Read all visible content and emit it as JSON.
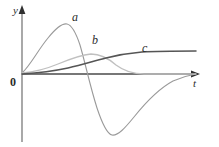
{
  "figure": {
    "title": "",
    "background_color": "#ffffff"
  },
  "axes": {
    "y_axis_label": "y",
    "x_axis_label": "t",
    "origin_label": "0",
    "axis_color": "#3a3a3a",
    "origin_px": {
      "x": 22,
      "y": 74
    },
    "x_axis_end_px": {
      "x": 198,
      "y": 74
    },
    "y_axis_top_px": {
      "x": 22,
      "y": 8
    },
    "y_axis_bottom_px": {
      "x": 22,
      "y": 142
    }
  },
  "curves": [
    {
      "id": "a",
      "label": "a",
      "color": "#9a9a9a",
      "stroke_width": 1.1,
      "description": "rises to a positive peak, crosses zero, dips to a deep negative trough, then returns asymptotically to zero",
      "path": "M 22,73 C 30,66 38,50 48,38 C 56,28 62,23 67,24 C 72,25 76,33 80,45 C 85,62 90,86 97,108 C 102,123 107,134 112,135 C 118,136 125,128 134,117 C 146,102 160,88 173,81 C 182,77 190,75 196,74"
    },
    {
      "id": "b",
      "label": "b",
      "color": "#c0c0c0",
      "stroke_width": 1.3,
      "description": "broad low hump peaking later than a, decaying smoothly back to zero",
      "path": "M 22,73 C 34,72 46,69 58,64 C 70,59 80,55 91,54 C 100,54 108,58 116,65 C 124,71 133,74 144,74 C 160,74 178,74 196,74"
    },
    {
      "id": "c",
      "label": "c",
      "color": "#555555",
      "stroke_width": 1.5,
      "description": "monotonic sigmoid rising from zero to a saturating plateau",
      "path": "M 22,74 C 38,73 54,71 68,68 C 82,65 94,61 106,58 C 118,55 130,53 142,52 C 158,51 176,51 196,51"
    }
  ],
  "curve_labels": [
    {
      "text": "a",
      "x": 72,
      "y": 11
    },
    {
      "text": "b",
      "x": 92,
      "y": 34
    },
    {
      "text": "c",
      "x": 142,
      "y": 42
    }
  ],
  "chart_data": {
    "type": "line",
    "title": "",
    "xlabel": "t",
    "ylabel": "y",
    "grid": false,
    "legend": "inline-curve-labels",
    "xlim": [
      0,
      1
    ],
    "ylim": [
      -1.2,
      1.05
    ],
    "axis_ticks": {
      "x": [],
      "y": []
    },
    "annotations": [
      "a",
      "b",
      "c",
      "0",
      "y",
      "t"
    ],
    "series": [
      {
        "name": "a",
        "color": "#9a9a9a",
        "x": [
          0.0,
          0.05,
          0.1,
          0.15,
          0.2,
          0.25,
          0.3,
          0.35,
          0.4,
          0.45,
          0.5,
          0.55,
          0.6,
          0.65,
          0.7,
          0.75,
          0.8,
          0.85,
          0.9,
          0.95,
          1.0
        ],
        "y": [
          0.01,
          0.18,
          0.42,
          0.65,
          0.8,
          0.86,
          0.8,
          0.62,
          0.34,
          0.02,
          -0.33,
          -0.63,
          -0.84,
          -0.88,
          -0.8,
          -0.63,
          -0.45,
          -0.3,
          -0.18,
          -0.08,
          -0.02
        ]
      },
      {
        "name": "b",
        "color": "#c0c0c0",
        "x": [
          0.0,
          0.05,
          0.1,
          0.15,
          0.2,
          0.25,
          0.3,
          0.35,
          0.4,
          0.45,
          0.5,
          0.55,
          0.6,
          0.65,
          0.7,
          0.75,
          0.8,
          0.85,
          0.9,
          0.95,
          1.0
        ],
        "y": [
          0.0,
          0.03,
          0.07,
          0.12,
          0.17,
          0.22,
          0.26,
          0.28,
          0.29,
          0.28,
          0.25,
          0.2,
          0.14,
          0.09,
          0.05,
          0.03,
          0.01,
          0.0,
          0.0,
          0.0,
          0.0
        ]
      },
      {
        "name": "c",
        "color": "#555555",
        "x": [
          0.0,
          0.05,
          0.1,
          0.15,
          0.2,
          0.25,
          0.3,
          0.35,
          0.4,
          0.45,
          0.5,
          0.55,
          0.6,
          0.65,
          0.7,
          0.75,
          0.8,
          0.85,
          0.9,
          0.95,
          1.0
        ],
        "y": [
          0.0,
          0.02,
          0.04,
          0.07,
          0.1,
          0.13,
          0.17,
          0.21,
          0.24,
          0.27,
          0.29,
          0.31,
          0.32,
          0.33,
          0.33,
          0.34,
          0.34,
          0.34,
          0.34,
          0.34,
          0.34
        ]
      }
    ]
  }
}
